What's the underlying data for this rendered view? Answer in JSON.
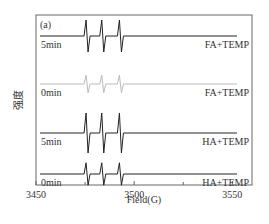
{
  "chart_data": {
    "type": "line",
    "panel_label": "(a)",
    "title": "",
    "xlabel": "Field(G)",
    "ylabel": "强度",
    "xlim": [
      3450,
      3560
    ],
    "xticks": [
      3450,
      3500,
      3550
    ],
    "minor_xticks": [
      3475,
      3525
    ],
    "yticks": [],
    "grid": false,
    "peak_positions_G": [
      3476,
      3484,
      3493
    ],
    "series": [
      {
        "name": "FA+TEMP 5min",
        "time_label": "5min",
        "sample_label": "FA+TEMP",
        "color": "#222222",
        "amplitude": 1.0,
        "offset_index": 0
      },
      {
        "name": "FA+TEMP 0min",
        "time_label": "0min",
        "sample_label": "FA+TEMP",
        "color": "#bbbbbb",
        "amplitude": 0.55,
        "offset_index": 1
      },
      {
        "name": "HA+TEMP 5min",
        "time_label": "5min",
        "sample_label": "HA+TEMP",
        "color": "#222222",
        "amplitude": 1.25,
        "offset_index": 2
      },
      {
        "name": "HA+TEMP 0min",
        "time_label": "0min",
        "sample_label": "HA+TEMP",
        "color": "#222222",
        "amplitude": 0.7,
        "offset_index": 3
      }
    ]
  }
}
